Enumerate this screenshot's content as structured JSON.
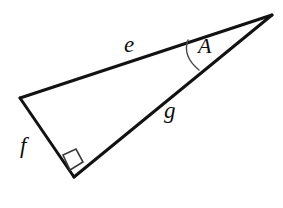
{
  "figure": {
    "kind": "geometry-diagram",
    "shape": "right-triangle",
    "background_color": "#ffffff",
    "stroke_color": "#121212",
    "stroke_width_px": 3,
    "arc_color": "#4a4a4a",
    "arc_width_px": 1.4,
    "right_angle_marker_color": "#3a3a3a",
    "right_angle_marker_width_px": 1.6
  },
  "vertices": {
    "apex_right": {
      "name": "apex-right",
      "x": 272,
      "y": 15
    },
    "left": {
      "name": "vertex-left",
      "x": 20,
      "y": 98
    },
    "bottom": {
      "name": "vertex-bottom-right-angle",
      "x": 74,
      "y": 177
    }
  },
  "edges": [
    {
      "id": "e",
      "label": "e",
      "name": "side-e",
      "from": "left",
      "to": "apex_right",
      "description": "upper long side from left vertex to right apex"
    },
    {
      "id": "f",
      "label": "f",
      "name": "side-f",
      "from": "left",
      "to": "bottom",
      "description": "short left side from left vertex down to bottom vertex"
    },
    {
      "id": "g",
      "label": "g",
      "name": "side-g",
      "from": "bottom",
      "to": "apex_right",
      "description": "lower long side from bottom vertex to right apex, the hypotenuse"
    }
  ],
  "angles": [
    {
      "id": "A",
      "label": "A",
      "name": "angle-A",
      "at_vertex": "apex_right",
      "between_sides": [
        "e",
        "g"
      ],
      "marker": "arc",
      "arc_start": {
        "x": 188,
        "y": 40
      },
      "arc_end": {
        "x": 199,
        "y": 70
      },
      "arc_control": {
        "x": 182,
        "y": 56
      }
    },
    {
      "id": "right-angle",
      "label": "",
      "name": "right-angle-marker",
      "at_vertex": "bottom",
      "between_sides": [
        "f",
        "g"
      ],
      "marker": "square",
      "measure_degrees": 90,
      "square_points": "63,155 76,149 83,162 70,170"
    }
  ],
  "labels": {
    "e": "e",
    "f": "f",
    "g": "g",
    "A": "A"
  }
}
